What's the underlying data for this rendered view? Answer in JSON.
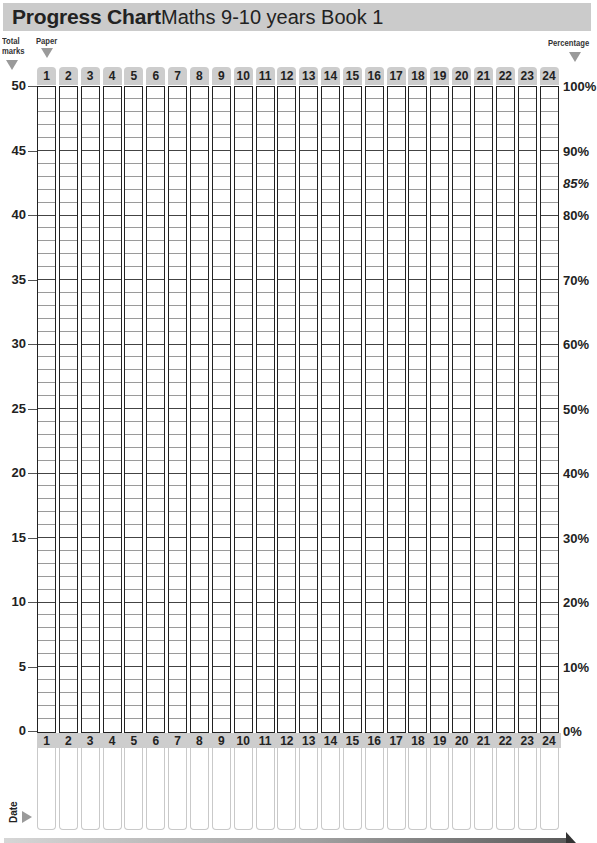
{
  "header": {
    "title": "Progress Chart",
    "subtitle": "Maths 9-10 years Book 1"
  },
  "labels": {
    "total_marks": "Total marks",
    "total_line1": "Total",
    "total_line2": "marks",
    "paper": "Paper",
    "percentage": "Percentage",
    "date": "Date"
  },
  "papers": [
    "1",
    "2",
    "3",
    "4",
    "5",
    "6",
    "7",
    "8",
    "9",
    "10",
    "11",
    "12",
    "13",
    "14",
    "15",
    "16",
    "17",
    "18",
    "19",
    "20",
    "21",
    "22",
    "23",
    "24"
  ],
  "marks_axis": [
    "50",
    "45",
    "40",
    "35",
    "30",
    "25",
    "20",
    "15",
    "10",
    "5",
    "0"
  ],
  "percent_axis": [
    {
      "label": "100%",
      "marks": 50,
      "italic": false
    },
    {
      "label": "90%",
      "marks": 45,
      "italic": false
    },
    {
      "label": "85%",
      "marks": 42.5,
      "italic": true
    },
    {
      "label": "80%",
      "marks": 40,
      "italic": false
    },
    {
      "label": "70%",
      "marks": 35,
      "italic": false
    },
    {
      "label": "60%",
      "marks": 30,
      "italic": false
    },
    {
      "label": "50%",
      "marks": 25,
      "italic": false
    },
    {
      "label": "40%",
      "marks": 20,
      "italic": false
    },
    {
      "label": "30%",
      "marks": 15,
      "italic": false
    },
    {
      "label": "20%",
      "marks": 10,
      "italic": false
    },
    {
      "label": "10%",
      "marks": 5,
      "italic": false
    },
    {
      "label": "0%",
      "marks": 0,
      "italic": false
    }
  ],
  "colors": {
    "title_bar": "#cbcbcb",
    "tab": "#cdcdcd",
    "grid_major": "#444444",
    "grid_minor": "#9a9a9a"
  }
}
